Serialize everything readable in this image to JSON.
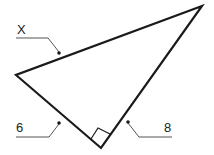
{
  "diagram": {
    "type": "right-triangle",
    "labels": {
      "hypotenuse": "X",
      "leg_left": "6",
      "leg_right": "8"
    },
    "right_angle_marker": true,
    "colors": {
      "stroke": "#1a1a1a",
      "leader": "#555555"
    }
  }
}
